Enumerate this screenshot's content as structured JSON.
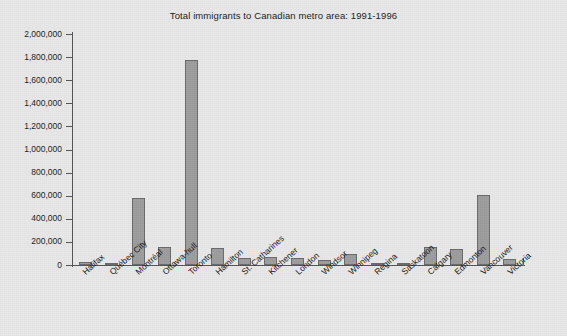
{
  "chart_data": {
    "type": "bar",
    "title": "Total immigrants to Canadian metro area: 1991-1996",
    "xlabel": "",
    "ylabel": "",
    "ylim": [
      0,
      2000000
    ],
    "grid": false,
    "legend": null,
    "categories": [
      "Halifax",
      "Québec City",
      "Montréal",
      "Ottawa-hull",
      "Toronto",
      "Hamilton",
      "St. Catharines",
      "Kitchener",
      "London",
      "Windsor",
      "Winnipeg",
      "Regina",
      "Saskatoon",
      "Calgary",
      "Edmonton",
      "Vancouver",
      "Victoria"
    ],
    "values": [
      28000,
      14000,
      580000,
      160000,
      1775000,
      147000,
      60000,
      70000,
      62000,
      45000,
      95000,
      10000,
      12000,
      152000,
      140000,
      606000,
      55000
    ],
    "y_ticks": [
      0,
      200000,
      400000,
      600000,
      800000,
      1000000,
      1200000,
      1400000,
      1600000,
      1800000,
      2000000
    ],
    "y_tick_labels": [
      "0",
      "200,000",
      "400,000",
      "600,000",
      "800,000",
      "1,000,000",
      "1,200,000",
      "1,400,000",
      "1,600,000",
      "1,800,000",
      "2,000,000"
    ],
    "colors": {
      "bar_fill": "#9d9d9d",
      "bar_stroke": "#6a6a6a",
      "axis": "#555555",
      "background": "#e8e8e8",
      "text": "#1b1b1b"
    }
  }
}
